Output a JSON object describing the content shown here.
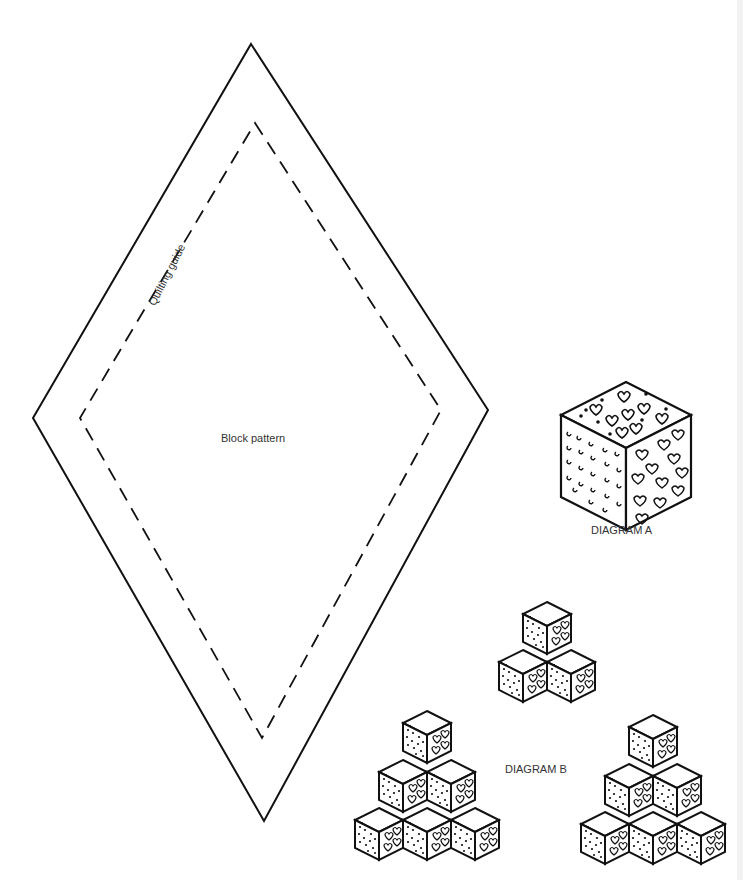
{
  "template": {
    "shape": "diamond",
    "outer_outline": {
      "top": [
        251,
        44
      ],
      "left": [
        33,
        418
      ],
      "bottom": [
        264,
        821
      ],
      "right": [
        488,
        410
      ]
    },
    "inner_dashed": {
      "top": [
        255,
        123
      ],
      "left": [
        80,
        418
      ],
      "bottom": [
        262,
        738
      ],
      "right": [
        441,
        410
      ]
    },
    "labels": {
      "quilting_guide": "Quilting guide",
      "block_pattern": "Block pattern"
    }
  },
  "diagram_a": {
    "caption": "DIAGRAM A",
    "description": "Single tumbling block cube with three patterned faces: top with flower motifs, left with dotted/curl print, right with hearts"
  },
  "diagram_b": {
    "caption": "DIAGRAM B",
    "arrangements": [
      {
        "name": "small-stack",
        "rows": [
          1,
          2
        ]
      },
      {
        "name": "left-pyramid",
        "rows": [
          1,
          2,
          3
        ]
      },
      {
        "name": "right-pyramid",
        "rows": [
          1,
          2,
          3
        ]
      }
    ]
  },
  "colors": {
    "line": "#111111",
    "text": "#333333",
    "background": "#ffffff"
  }
}
